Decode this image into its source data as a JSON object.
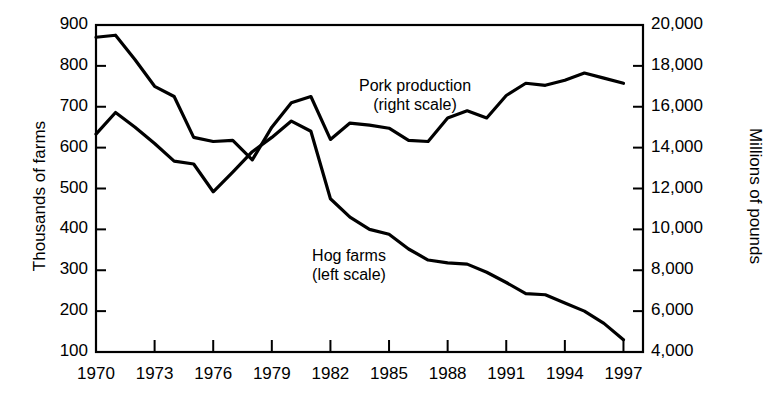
{
  "chart_data": {
    "type": "line",
    "title": "",
    "subtitle": "",
    "xlabel": "",
    "ylabel": "Thousands of farms",
    "ylabel_right": "Millions of pounds",
    "grid": false,
    "legend_position": "inline-annotation",
    "x": [
      1970,
      1971,
      1972,
      1973,
      1974,
      1975,
      1976,
      1977,
      1978,
      1979,
      1980,
      1981,
      1982,
      1983,
      1984,
      1985,
      1986,
      1987,
      1988,
      1989,
      1990,
      1991,
      1992,
      1993,
      1994,
      1995,
      1996,
      1997
    ],
    "xlim": [
      1970,
      1998
    ],
    "xticks": [
      1970,
      1973,
      1976,
      1979,
      1982,
      1985,
      1988,
      1991,
      1994,
      1997
    ],
    "xticklabels": [
      "1970",
      "1973",
      "1976",
      "1979",
      "1982",
      "1985",
      "1988",
      "1991",
      "1994",
      "1997"
    ],
    "ylim_left": [
      100,
      900
    ],
    "yticks_left": [
      100,
      200,
      300,
      400,
      500,
      600,
      700,
      800,
      900
    ],
    "yticklabels_left": [
      "100",
      "200",
      "300",
      "400",
      "500",
      "600",
      "700",
      "800",
      "900"
    ],
    "ylim_right": [
      4000,
      20000
    ],
    "yticks_right": [
      4000,
      6000,
      8000,
      10000,
      12000,
      14000,
      16000,
      18000,
      20000
    ],
    "yticklabels_right": [
      "4,000",
      "6,000",
      "8,000",
      "10,000",
      "12,000",
      "14,000",
      "16,000",
      "18,000",
      "20,000"
    ],
    "series": [
      {
        "name": "Hog farms",
        "axis": "left",
        "units": "thousands of farms",
        "annotation": "Hog farms\n(left scale)",
        "values": [
          633,
          686,
          650,
          610,
          567,
          560,
          492,
          540,
          590,
          625,
          665,
          640,
          475,
          430,
          400,
          388,
          352,
          325,
          318,
          315,
          295,
          270,
          243,
          240,
          220,
          200,
          170,
          130
        ]
      },
      {
        "name": "Pork production",
        "axis": "right",
        "units": "millions of pounds",
        "annotation": "Pork production\n(right scale)",
        "values": [
          19400,
          19500,
          18300,
          17000,
          16500,
          14500,
          14300,
          14350,
          13400,
          15000,
          16200,
          16500,
          14400,
          15200,
          15100,
          14950,
          14350,
          14300,
          15450,
          15800,
          15450,
          16550,
          17150,
          17050,
          17300,
          17650,
          17400,
          17150
        ]
      }
    ],
    "annotations": [
      {
        "name": "pork-label",
        "line1": "Pork production",
        "line2": "(right scale)"
      },
      {
        "name": "hog-label",
        "line1": "Hog farms",
        "line2": "(left scale)"
      }
    ],
    "colors": {
      "line": "#000000",
      "background": "#ffffff",
      "axis": "#000000"
    }
  },
  "axis_left": {
    "title": "Thousands of farms"
  },
  "axis_right": {
    "title": "Millions of pounds"
  }
}
